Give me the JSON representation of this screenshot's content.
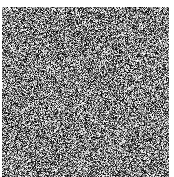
{
  "image": {
    "kind": "random-grayscale-noise",
    "width": 174,
    "height": 177,
    "background_color": "#ffffff",
    "alt_text": "Full-frame random grayscale static noise",
    "noise_field": {
      "left": 2,
      "top": 7,
      "right": 169,
      "bottom": 177,
      "width": 167,
      "height": 170,
      "grain_size_px": 1,
      "distribution": "uniform",
      "gray_min": 0,
      "gray_max": 255,
      "gray_mean": 128,
      "monochrome": true,
      "seed": 174177
    },
    "margins": {
      "top_px": 7,
      "left_px": 2,
      "right_px": 5,
      "bottom_px": 0,
      "color": "#ffffff"
    }
  }
}
